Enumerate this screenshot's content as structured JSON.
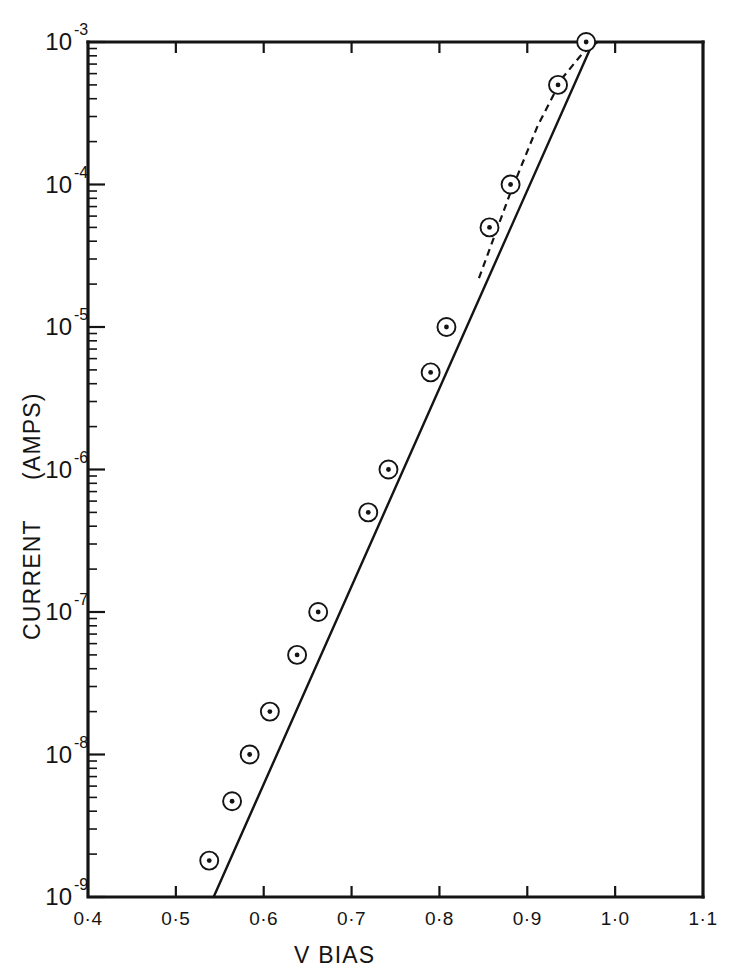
{
  "chart_data": {
    "type": "scatter",
    "title": "",
    "xlabel": "V BIAS",
    "ylabel": "CURRENT  (AMPS)",
    "ylabel_main": "CURRENT",
    "ylabel_unit": "(AMPS)",
    "xlim": [
      0.4,
      1.1
    ],
    "ylim": [
      1e-09,
      0.001
    ],
    "yscale": "log",
    "xscale": "linear",
    "grid": false,
    "legend": false,
    "x_ticks": [
      0.4,
      0.5,
      0.6,
      0.7,
      0.8,
      0.9,
      1.0,
      1.1
    ],
    "x_tick_labels": [
      "0·4",
      "0·5",
      "0·6",
      "0·7",
      "0·8",
      "0·9",
      "1·0",
      "1·1"
    ],
    "y_ticks": [
      1e-09,
      1e-08,
      1e-07,
      1e-06,
      1e-05,
      0.0001,
      0.001
    ],
    "y_tick_labels": [
      {
        "mantissa": "10",
        "exponent": "-9"
      },
      {
        "mantissa": "10",
        "exponent": "-8"
      },
      {
        "mantissa": "10",
        "exponent": "-7"
      },
      {
        "mantissa": "10",
        "exponent": "-6"
      },
      {
        "mantissa": "10",
        "exponent": "-5"
      },
      {
        "mantissa": "10",
        "exponent": "-4"
      },
      {
        "mantissa": "10",
        "exponent": "-3"
      }
    ],
    "series": [
      {
        "name": "measured diode current",
        "marker": "circle-with-center-dot",
        "x": [
          0.538,
          0.564,
          0.584,
          0.607,
          0.638,
          0.662,
          0.719,
          0.742,
          0.79,
          0.808,
          0.857,
          0.881,
          0.935,
          0.967
        ],
        "y": [
          1.8e-09,
          4.7e-09,
          1e-08,
          2e-08,
          5e-08,
          1e-07,
          5e-07,
          1e-06,
          4.8e-06,
          1e-05,
          5e-05,
          0.0001,
          0.0005,
          0.001
        ]
      }
    ],
    "fit_line": {
      "name": "ideal exponential fit",
      "style": "solid",
      "x": [
        0.543,
        0.975
      ],
      "y": [
        1e-09,
        0.001
      ]
    },
    "dashed_line": {
      "name": "series-resistance limited branch",
      "style": "dashed",
      "x": [
        0.845,
        0.88,
        0.912,
        0.94,
        0.962,
        0.98
      ],
      "y": [
        2.2e-05,
        8.5e-05,
        0.00026,
        0.00056,
        0.00082,
        0.001
      ]
    },
    "marker_radius_px": 9,
    "colors": {
      "axis": "#141414",
      "line": "#141414",
      "marker_fill": "#ffffff",
      "background": "#ffffff"
    }
  }
}
